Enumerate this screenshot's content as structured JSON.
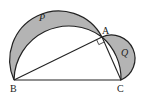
{
  "diagram": {
    "type": "geometry",
    "colors": {
      "shade": "#b4b4b4",
      "stroke": "#222222",
      "background": "#ffffff"
    },
    "points": {
      "A": {
        "label": "A",
        "x": 102,
        "y": 37
      },
      "B": {
        "label": "B",
        "x": 14,
        "y": 80
      },
      "C": {
        "label": "C",
        "x": 121,
        "y": 80
      }
    },
    "regions": {
      "P": {
        "label": "P"
      },
      "Q": {
        "label": "Q"
      }
    },
    "right_angle_at": "A"
  }
}
